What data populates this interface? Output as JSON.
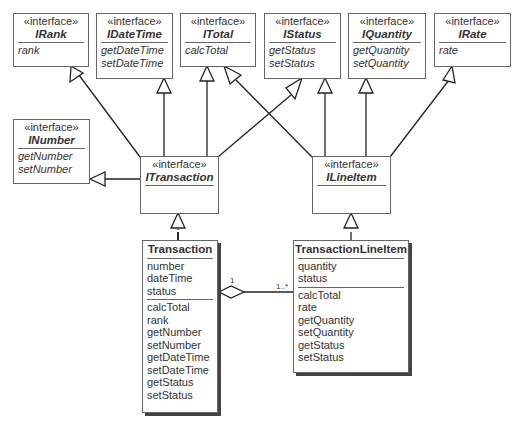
{
  "diagram": {
    "type": "UML class diagram",
    "stereotype": "«interface»",
    "interfaces": [
      {
        "id": "irank",
        "name": "IRank",
        "members": [
          "rank"
        ]
      },
      {
        "id": "idatetime",
        "name": "IDateTime",
        "members": [
          "getDateTime",
          "setDateTime"
        ]
      },
      {
        "id": "itotal",
        "name": "ITotal",
        "members": [
          "calcTotal"
        ]
      },
      {
        "id": "istatus",
        "name": "IStatus",
        "members": [
          "getStatus",
          "setStatus"
        ]
      },
      {
        "id": "iquantity",
        "name": "IQuantity",
        "members": [
          "getQuantity",
          "setQuantity"
        ]
      },
      {
        "id": "irate",
        "name": "IRate",
        "members": [
          "rate"
        ]
      },
      {
        "id": "inumber",
        "name": "INumber",
        "members": [
          "getNumber",
          "setNumber"
        ]
      },
      {
        "id": "itransaction",
        "name": "ITransaction",
        "members": []
      },
      {
        "id": "ilineitem",
        "name": "ILineItem",
        "members": []
      }
    ],
    "classes": [
      {
        "id": "transaction",
        "name": "Transaction",
        "attributes": [
          "number",
          "dateTime",
          "status"
        ],
        "operations": [
          "calcTotal",
          "rank",
          "getNumber",
          "setNumber",
          "getDateTime",
          "setDateTime",
          "getStatus",
          "setStatus"
        ]
      },
      {
        "id": "transactionlineitem",
        "name": "TransactionLineItem",
        "attributes": [
          "quantity",
          "status"
        ],
        "operations": [
          "calcTotal",
          "rate",
          "getQuantity",
          "setQuantity",
          "getStatus",
          "setStatus"
        ]
      }
    ],
    "relationships": [
      {
        "type": "generalization",
        "from": "ITransaction",
        "to": "IRank"
      },
      {
        "type": "generalization",
        "from": "ITransaction",
        "to": "IDateTime"
      },
      {
        "type": "generalization",
        "from": "ITransaction",
        "to": "ITotal"
      },
      {
        "type": "generalization",
        "from": "ITransaction",
        "to": "IStatus"
      },
      {
        "type": "generalization",
        "from": "ITransaction",
        "to": "INumber"
      },
      {
        "type": "generalization",
        "from": "ILineItem",
        "to": "ITotal"
      },
      {
        "type": "generalization",
        "from": "ILineItem",
        "to": "IStatus"
      },
      {
        "type": "generalization",
        "from": "ILineItem",
        "to": "IQuantity"
      },
      {
        "type": "generalization",
        "from": "ILineItem",
        "to": "IRate"
      },
      {
        "type": "realization",
        "from": "Transaction",
        "to": "ITransaction"
      },
      {
        "type": "realization",
        "from": "TransactionLineItem",
        "to": "ILineItem"
      },
      {
        "type": "aggregation",
        "whole": "Transaction",
        "part": "TransactionLineItem",
        "whole_multiplicity": "1",
        "part_multiplicity": "1..*"
      }
    ]
  }
}
